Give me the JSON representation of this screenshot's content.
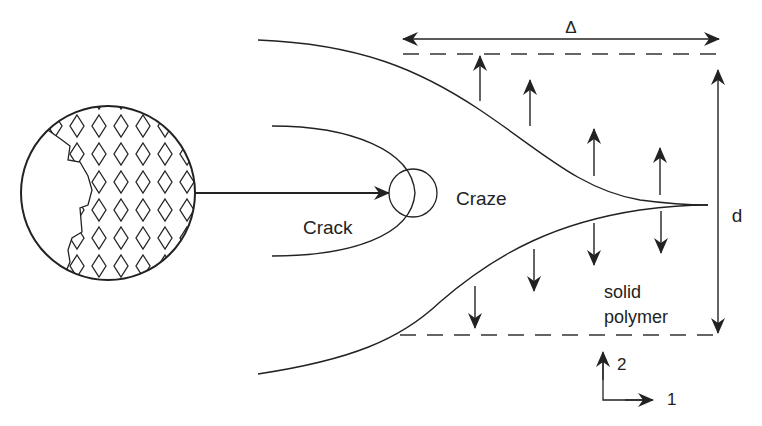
{
  "diagram": {
    "labels": {
      "delta": "Δ",
      "d": "d",
      "crack": "Crack",
      "craze": "Craze",
      "solid_line1": "solid",
      "solid_line2": "polymer",
      "axis_2": "2",
      "axis_1": "1"
    },
    "colors": {
      "line": "#222222",
      "background": "#ffffff"
    },
    "up_arrows_x": [
      480,
      530,
      594,
      660
    ],
    "down_arrows_x": [
      475,
      534,
      594,
      661
    ]
  }
}
